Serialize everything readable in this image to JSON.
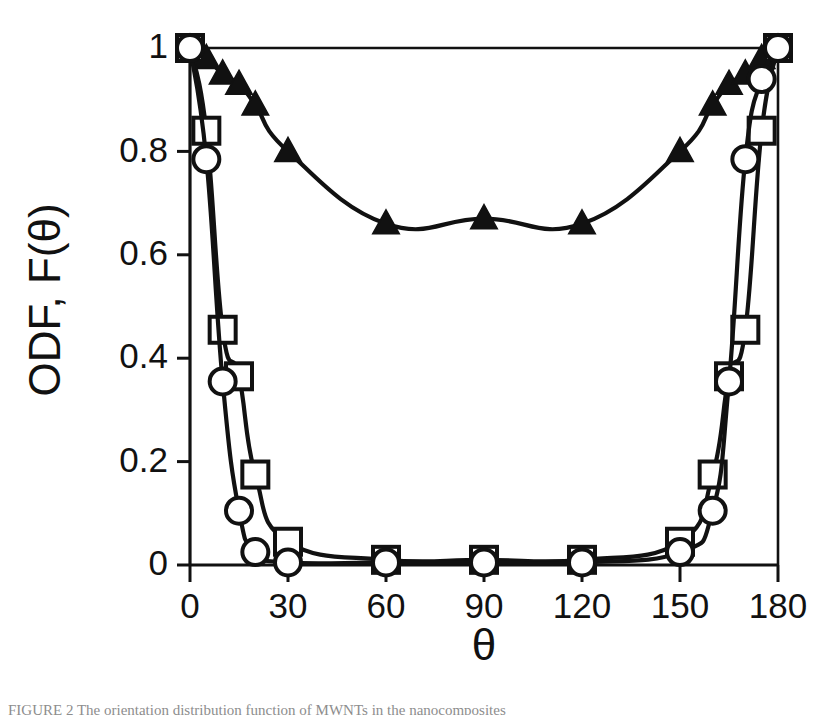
{
  "figure": {
    "background_color": "#ffffff",
    "ink_color": "#111111",
    "caption_partial": "FIGURE 2   The orientation distribution function of MWNTs in the nanocomposites"
  },
  "chart_data": {
    "type": "line",
    "title": "",
    "subtitle": "",
    "xlabel": "θ",
    "ylabel": "ODF, F(θ)",
    "xlim": [
      0,
      180
    ],
    "ylim": [
      0,
      1
    ],
    "xticks": [
      0,
      30,
      60,
      90,
      120,
      150,
      180
    ],
    "xticklabels": [
      "0",
      "30",
      "60",
      "90",
      "120",
      "150",
      "180"
    ],
    "yticks": [
      0,
      0.2,
      0.4,
      0.6,
      0.8,
      1
    ],
    "yticklabels": [
      "0",
      "0.2",
      "0.4",
      "0.6",
      "0.8",
      "1"
    ],
    "grid": false,
    "legend": "none",
    "frame": "box",
    "annotations": [],
    "series": [
      {
        "name": "filled-triangle-series",
        "marker": "triangle-up-filled",
        "marker_fill": "#111111",
        "line_color": "#111111",
        "x": [
          0,
          5,
          10,
          15,
          20,
          30,
          60,
          90,
          120,
          150,
          160,
          165,
          170,
          175,
          180
        ],
        "y": [
          1.0,
          0.98,
          0.95,
          0.93,
          0.89,
          0.8,
          0.66,
          0.67,
          0.66,
          0.8,
          0.89,
          0.93,
          0.95,
          0.98,
          1.0
        ]
      },
      {
        "name": "open-square-series",
        "marker": "square-open",
        "marker_fill": "#ffffff",
        "line_color": "#111111",
        "x": [
          0,
          5,
          10,
          15,
          20,
          30,
          60,
          90,
          120,
          150,
          160,
          165,
          170,
          175,
          180
        ],
        "y": [
          1.0,
          0.84,
          0.455,
          0.365,
          0.175,
          0.045,
          0.01,
          0.01,
          0.01,
          0.045,
          0.175,
          0.365,
          0.455,
          0.84,
          1.0
        ]
      },
      {
        "name": "open-circle-series",
        "marker": "circle-open",
        "marker_fill": "#ffffff",
        "line_color": "#111111",
        "x": [
          0,
          5,
          10,
          15,
          20,
          30,
          60,
          90,
          120,
          150,
          160,
          165,
          170,
          175,
          180
        ],
        "y": [
          1.0,
          0.785,
          0.355,
          0.105,
          0.025,
          0.005,
          0.005,
          0.005,
          0.005,
          0.025,
          0.105,
          0.355,
          0.785,
          0.94,
          1.0
        ]
      }
    ]
  },
  "axis": {
    "x_title": "θ",
    "y_title": "ODF, F(θ)"
  }
}
